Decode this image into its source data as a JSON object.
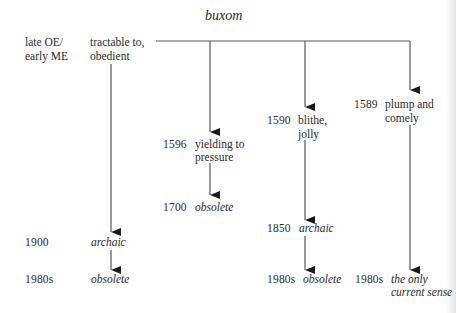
{
  "title": "buxom",
  "root": {
    "date": "late OE/\nearly ME",
    "date_line1": "late OE/",
    "date_line2": "early ME",
    "sense_line1": "tractable to,",
    "sense_line2": "obedient"
  },
  "branches": [
    {
      "date": "1596",
      "sense_line1": "yielding to",
      "sense_line2": "pressure",
      "next": {
        "date": "1700",
        "label": "obsolete"
      }
    },
    {
      "date": "1590",
      "sense_line1": "blithe,",
      "sense_line2": "jolly",
      "next": {
        "date": "1850",
        "label": "archaic"
      },
      "final": {
        "date": "1980s",
        "label": "obsolete"
      }
    },
    {
      "date": "1589",
      "sense_line1": "plump and",
      "sense_line2": "comely",
      "final": {
        "date": "1980s",
        "label_line1": "the only",
        "label_line2": "current sense"
      }
    }
  ],
  "root_chain": [
    {
      "date": "1900",
      "label": "archaic"
    },
    {
      "date": "1980s",
      "label": "obsolete"
    }
  ],
  "colors": {
    "line": "#555555",
    "text": "#2a2a2a",
    "background": "#ffffff"
  }
}
